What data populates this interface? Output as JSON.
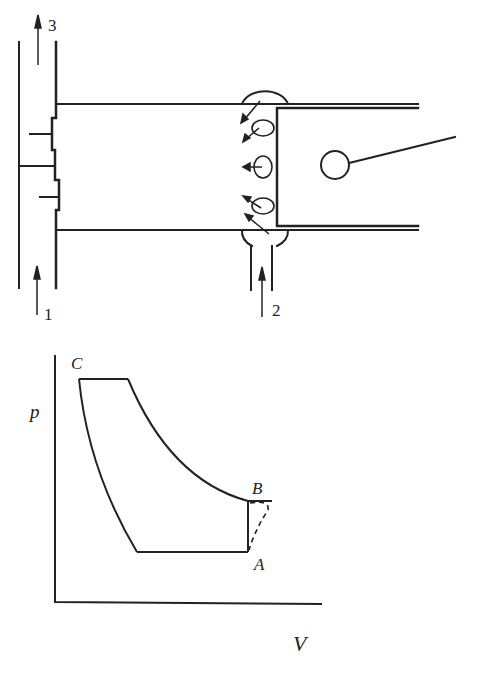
{
  "engine_diagram": {
    "labels": {
      "exhaust_flow": "3",
      "exhaust_inlet": "1",
      "scavenge_inlet": "2"
    },
    "stroke_color": "#222222",
    "background": "#ffffff"
  },
  "pv_diagram": {
    "axis_labels": {
      "y": "p",
      "x": "V"
    },
    "points": {
      "C": "C",
      "B": "B",
      "A": "A"
    }
  }
}
